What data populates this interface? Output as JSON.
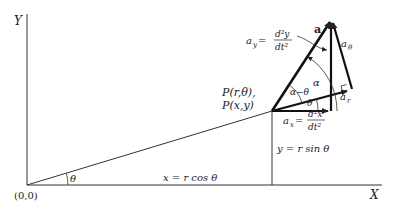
{
  "diagram": {
    "axes": {
      "x_label": "X",
      "y_label": "Y",
      "origin_label": "(0,0)"
    },
    "point": {
      "label_polar": "P(r,θ),",
      "label_cartesian": "P(x,y)"
    },
    "angles": {
      "theta_origin": "θ",
      "theta_at_p": "θ",
      "alpha": "α",
      "alpha_minus_theta": "α−θ"
    },
    "projections": {
      "x_eq": "x = r cos θ",
      "y_eq": "y = r sin θ"
    },
    "vectors": {
      "a": "a",
      "a_theta": "a",
      "a_theta_sub": "θ",
      "a_r": "a",
      "a_r_sub": "r",
      "a_y_lhs": "a",
      "a_y_sub": "y",
      "a_y_num": "d²y",
      "a_y_den": "dt²",
      "a_x_lhs": "a",
      "a_x_sub": "x",
      "a_x_num": "d²x",
      "a_x_den": "dt²"
    },
    "colors": {
      "line": "#222222",
      "background": "#ffffff"
    }
  }
}
